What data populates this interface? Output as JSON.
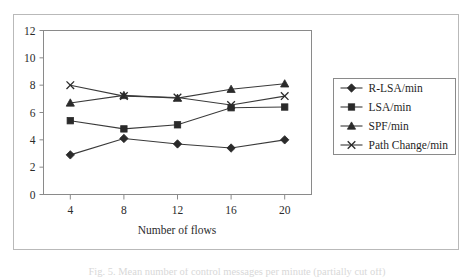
{
  "figure": {
    "caption": "Fig. 5. Mean number of control messages per minute (partially cut off)",
    "caption_visible": false
  },
  "chart_data": {
    "type": "line",
    "title": "",
    "xlabel": "Number of flows",
    "ylabel": "",
    "categories": [
      4,
      8,
      12,
      16,
      20
    ],
    "x_tick_labels": [
      "4",
      "8",
      "12",
      "16",
      "20"
    ],
    "y_tick_labels": [
      "0",
      "2",
      "4",
      "6",
      "8",
      "10",
      "12"
    ],
    "y_ticks": [
      0,
      2,
      4,
      6,
      8,
      10,
      12
    ],
    "xlim": [
      2,
      22
    ],
    "ylim": [
      0,
      12
    ],
    "grid": false,
    "legend_position": "right",
    "series": [
      {
        "name": "R-LSA/min",
        "marker": "diamond-icon",
        "values": [
          2.9,
          4.1,
          3.7,
          3.4,
          4.0
        ]
      },
      {
        "name": "LSA/min",
        "marker": "square-icon",
        "values": [
          5.4,
          4.8,
          5.1,
          6.35,
          6.4
        ]
      },
      {
        "name": "SPF/min",
        "marker": "triangle-icon",
        "values": [
          6.7,
          7.25,
          7.05,
          7.7,
          8.1
        ]
      },
      {
        "name": "Path Change/min",
        "marker": "cross-icon",
        "values": [
          8.0,
          7.2,
          7.1,
          6.55,
          7.2
        ]
      }
    ]
  },
  "colors": {
    "line": "#3a3a3a",
    "marker": "#2a2a2a",
    "axis": "#8a8a8a",
    "frame": "#b9b9b9",
    "text": "#2b2b2b",
    "background": "#ffffff"
  }
}
